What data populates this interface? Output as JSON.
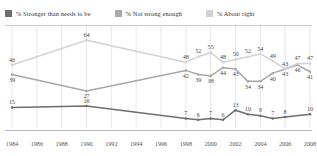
{
  "legend": {
    "items": [
      {
        "label": "% Stronger than needs to be",
        "color": "#6e6e6e",
        "key": "stronger"
      },
      {
        "label": "% Not strong enough",
        "color": "#a8a8a8",
        "key": "not_strong"
      },
      {
        "label": "% About right",
        "color": "#d2d2d2",
        "key": "about_right"
      }
    ]
  },
  "chart_data": {
    "type": "line",
    "title": "",
    "subtitle": "",
    "xlabel": "",
    "ylabel": "",
    "x": [
      1984,
      1986,
      1988,
      1990,
      1992,
      1994,
      1996,
      1998,
      1999,
      2000,
      2001,
      2002,
      2003,
      2004,
      2005,
      2006,
      2007,
      2008
    ],
    "categories": [
      "1984",
      "1986",
      "1988",
      "1990",
      "1992",
      "1994",
      "1996",
      "1998",
      "2000",
      "2002",
      "2004",
      "2006",
      "2008"
    ],
    "tick_labels": [
      "1984",
      "1986",
      "1988",
      "1990",
      "1992",
      "1994",
      "1996",
      "1998",
      "2000",
      "2002",
      "2004",
      "2006",
      "2008"
    ],
    "ylim": [
      0,
      70
    ],
    "xlim": [
      1984,
      2008
    ],
    "grid": "vertical",
    "legend_position": "top",
    "series": [
      {
        "name": "% Stronger than needs to be",
        "color": "#6e6e6e",
        "points": [
          {
            "x": 1984,
            "y": 15,
            "label": "15"
          },
          {
            "x": 1990,
            "y": 16,
            "label": "16"
          },
          {
            "x": 1998,
            "y": 7,
            "label": "7"
          },
          {
            "x": 1999,
            "y": 6,
            "label": "6"
          },
          {
            "x": 2000,
            "y": 7,
            "label": "7"
          },
          {
            "x": 2001,
            "y": 6,
            "label": "6"
          },
          {
            "x": 2002,
            "y": 13,
            "label": "13"
          },
          {
            "x": 2003,
            "y": 10,
            "label": "10"
          },
          {
            "x": 2004,
            "y": 9,
            "label": "9"
          },
          {
            "x": 2005,
            "y": 7,
            "label": "7"
          },
          {
            "x": 2006,
            "y": 8,
            "label": "8"
          },
          {
            "x": 2008,
            "y": 10,
            "label": "10"
          }
        ]
      },
      {
        "name": "% Not strong enough",
        "color": "#a8a8a8",
        "points": [
          {
            "x": 1984,
            "y": 39,
            "label": "39"
          },
          {
            "x": 1990,
            "y": 27,
            "label": "27"
          },
          {
            "x": 1998,
            "y": 42,
            "label": "42"
          },
          {
            "x": 1999,
            "y": 39,
            "label": "39"
          },
          {
            "x": 2000,
            "y": 38,
            "label": "38"
          },
          {
            "x": 2001,
            "y": 44,
            "label": "44"
          },
          {
            "x": 2002,
            "y": 43,
            "label": "43"
          },
          {
            "x": 2003,
            "y": 34,
            "label": "34"
          },
          {
            "x": 2004,
            "y": 34,
            "label": "34"
          },
          {
            "x": 2005,
            "y": 40,
            "label": "40"
          },
          {
            "x": 2006,
            "y": 43,
            "label": "43"
          },
          {
            "x": 2007,
            "y": 46,
            "label": "46"
          },
          {
            "x": 2008,
            "y": 41,
            "label": "41"
          }
        ]
      },
      {
        "name": "% About right",
        "color": "#d2d2d2",
        "points": [
          {
            "x": 1984,
            "y": 46,
            "label": "46"
          },
          {
            "x": 1990,
            "y": 64,
            "label": "64"
          },
          {
            "x": 1998,
            "y": 48,
            "label": "48"
          },
          {
            "x": 1999,
            "y": 52,
            "label": "52"
          },
          {
            "x": 2000,
            "y": 55,
            "label": "55"
          },
          {
            "x": 2001,
            "y": 48,
            "label": "48"
          },
          {
            "x": 2002,
            "y": 50,
            "label": "50"
          },
          {
            "x": 2003,
            "y": 52,
            "label": "52"
          },
          {
            "x": 2004,
            "y": 54,
            "label": "54"
          },
          {
            "x": 2005,
            "y": 49,
            "label": "49"
          },
          {
            "x": 2006,
            "y": 43,
            "label": "43"
          },
          {
            "x": 2007,
            "y": 47,
            "label": "47"
          },
          {
            "x": 2008,
            "y": 47,
            "label": "47"
          }
        ]
      }
    ]
  },
  "style": {
    "grid_color": "#dcdcdc",
    "axis_color": "#b9b9b9",
    "label_color": "#555555",
    "background": "#ffffff"
  }
}
